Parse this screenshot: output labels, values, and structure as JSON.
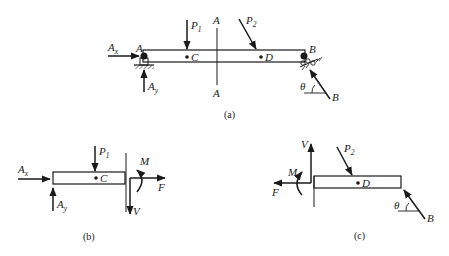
{
  "figure": {
    "panels": [
      {
        "id": "a",
        "caption": "(a)",
        "beam": {
          "left_end": "A",
          "right_end": "B",
          "points": [
            "C",
            "D"
          ]
        },
        "section_line": {
          "top_label": "A",
          "bottom_label": "A"
        },
        "loads": [
          {
            "name": "P",
            "sub": "1",
            "direction": "down",
            "at": "C"
          },
          {
            "name": "P",
            "sub": "2",
            "direction": "diagonal-down-right",
            "at": "D"
          }
        ],
        "reactions": [
          {
            "name": "A",
            "sub": "x",
            "direction": "right",
            "at": "A"
          },
          {
            "name": "A",
            "sub": "y",
            "direction": "up",
            "at": "A"
          },
          {
            "name": "B",
            "sub": "",
            "direction": "diagonal-up-left",
            "at": "B",
            "angle": "θ"
          }
        ],
        "supports": {
          "A": "pin",
          "B": "roller"
        }
      },
      {
        "id": "b",
        "caption": "(b)",
        "beam": {
          "points": [
            "C"
          ]
        },
        "loads": [
          {
            "name": "P",
            "sub": "1",
            "direction": "down"
          },
          {
            "name": "A",
            "sub": "x",
            "direction": "right"
          },
          {
            "name": "A",
            "sub": "y",
            "direction": "up"
          }
        ],
        "internal": {
          "moment": "M",
          "axial": "F",
          "shear": "V"
        }
      },
      {
        "id": "c",
        "caption": "(c)",
        "beam": {
          "points": [
            "D"
          ]
        },
        "loads": [
          {
            "name": "P",
            "sub": "2",
            "direction": "diagonal-down-right"
          },
          {
            "name": "B",
            "sub": "",
            "direction": "diagonal-up-left",
            "angle": "θ"
          }
        ],
        "internal": {
          "moment": "M",
          "axial": "F",
          "shear": "V"
        }
      }
    ]
  },
  "labels": {
    "a": {
      "A_left": "A",
      "B_right": "B",
      "B_force": "B",
      "C": "C",
      "D": "D",
      "sec_top": "A",
      "sec_bot": "A",
      "P1": "P",
      "P1_sub": "1",
      "P2": "P",
      "P2_sub": "2",
      "Ax": "A",
      "Ax_sub": "x",
      "Ay": "A",
      "Ay_sub": "y",
      "theta": "θ",
      "caption": "(a)"
    },
    "b": {
      "C": "C",
      "P1": "P",
      "P1_sub": "1",
      "Ax": "A",
      "Ax_sub": "x",
      "Ay": "A",
      "Ay_sub": "y",
      "M": "M",
      "F": "F",
      "V": "V",
      "caption": "(b)"
    },
    "c": {
      "D": "D",
      "P2": "P",
      "P2_sub": "2",
      "B": "B",
      "theta": "θ",
      "M": "M",
      "F": "F",
      "V": "V",
      "caption": "(c)"
    }
  },
  "colors": {
    "ink": "#1a1a1a",
    "background": "#ffffff"
  }
}
